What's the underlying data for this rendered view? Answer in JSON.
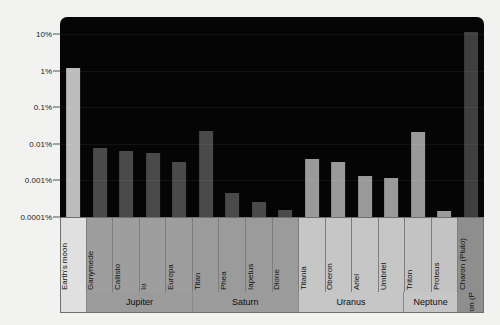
{
  "chart_data": {
    "type": "bar",
    "title": "",
    "xlabel": "",
    "ylabel": "",
    "scale": "log",
    "ylim": [
      0.0001,
      30
    ],
    "grid": true,
    "legend": "none",
    "ytick_labels": [
      "10%",
      "1%",
      "0.1%",
      "0.01%",
      "0.001%",
      "0.0001%"
    ],
    "ytick_values": [
      10,
      1,
      0.1,
      0.01,
      0.001,
      0.0001
    ],
    "categories": [
      "Earth's moon",
      "Ganymede",
      "Callisto",
      "Io",
      "Europa",
      "Titan",
      "Phea",
      "Iapetus",
      "Dione",
      "Titania",
      "Oberon",
      "Ariel",
      "Umbriel",
      "Triton",
      "Proteus",
      "Charon (Pluto)"
    ],
    "values": [
      1.2,
      0.0078,
      0.0065,
      0.0055,
      0.0032,
      0.023,
      0.00045,
      0.00025,
      0.00016,
      0.0039,
      0.0033,
      0.0013,
      0.0012,
      0.021,
      0.00015,
      12.0
    ],
    "groups": [
      {
        "label": "",
        "span": 1,
        "tone": "moon"
      },
      {
        "label": "Jupiter",
        "span": 4,
        "tone": "dark"
      },
      {
        "label": "Saturn",
        "span": 4,
        "tone": "dark"
      },
      {
        "label": "Uranus",
        "span": 4,
        "tone": "light"
      },
      {
        "label": "Neptune",
        "span": 2,
        "tone": "light"
      },
      {
        "label": "Charon (Pluto)",
        "span": 1,
        "tone": "darkest",
        "vertical": true
      }
    ],
    "bar_colors": [
      "#bcbcbc",
      "#4a4a4a",
      "#4a4a4a",
      "#4a4a4a",
      "#4a4a4a",
      "#4a4a4a",
      "#4a4a4a",
      "#4a4a4a",
      "#4a4a4a",
      "#9a9a9a",
      "#9a9a9a",
      "#9a9a9a",
      "#9a9a9a",
      "#9a9a9a",
      "#9a9a9a",
      "#3f3f3f"
    ],
    "cell_tones": [
      "#e0e0e0",
      "#9e9e9e",
      "#9e9e9e",
      "#9e9e9e",
      "#9e9e9e",
      "#9b9b9b",
      "#9b9b9b",
      "#9b9b9b",
      "#9b9b9b",
      "#c6c6c6",
      "#c6c6c6",
      "#c6c6c6",
      "#c6c6c6",
      "#c3c3c3",
      "#c3c3c3",
      "#8e8e8e"
    ],
    "plot_background": "#050505",
    "page_background": "#f2f2f0"
  }
}
